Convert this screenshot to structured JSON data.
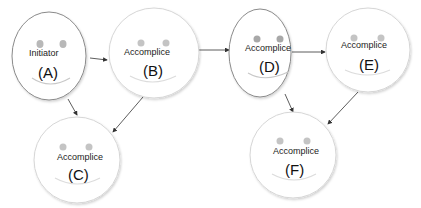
{
  "nodes": [
    {
      "id": "A",
      "role": "Initiator",
      "letter": "(A)"
    },
    {
      "id": "B",
      "role": "Accomplice",
      "letter": "(B)"
    },
    {
      "id": "C",
      "role": "Accomplice",
      "letter": "(C)"
    },
    {
      "id": "D",
      "role": "Accomplice",
      "letter": "(D)"
    },
    {
      "id": "E",
      "role": "Accomplice",
      "letter": "(E)"
    },
    {
      "id": "F",
      "role": "Accomplice",
      "letter": "(F)"
    }
  ],
  "edges": [
    {
      "from": "A",
      "to": "B"
    },
    {
      "from": "A",
      "to": "C"
    },
    {
      "from": "B",
      "to": "C"
    },
    {
      "from": "B",
      "to": "D"
    },
    {
      "from": "D",
      "to": "E"
    },
    {
      "from": "D",
      "to": "F"
    },
    {
      "from": "E",
      "to": "F"
    }
  ],
  "colors": {
    "outline_dark": "#8a8a8a",
    "outline_light": "#d8d8d8",
    "eye": "#b5b5b5",
    "smile": "#cfcfcf",
    "arrow": "#333333"
  }
}
